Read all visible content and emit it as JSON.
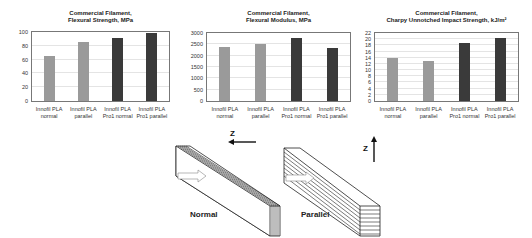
{
  "chart_data": [
    {
      "type": "bar",
      "title": "Commercial Filament, Flexural Strength, MPa",
      "title_lines": [
        "Commercial Filament,",
        "Flexural Strength, MPa"
      ],
      "categories": [
        "Innofil PLA normal",
        "Innofil PLA parallel",
        "Innofil PLA Pro1 normal",
        "Innofil PLA Pro1 parallel"
      ],
      "category_lines": [
        [
          "Innofil PLA",
          "normal"
        ],
        [
          "Innofil PLA",
          "parallel"
        ],
        [
          "Innofil PLA",
          "Pro1 normal"
        ],
        [
          "Innofil PLA",
          "Pro1 parallel"
        ]
      ],
      "values": [
        65,
        85,
        91,
        98
      ],
      "bar_colors": [
        "#9a9a9a",
        "#9a9a9a",
        "#3a3a3a",
        "#3a3a3a"
      ],
      "yticks": [
        0,
        20,
        40,
        60,
        80,
        100
      ],
      "ylim": [
        0,
        100
      ],
      "xlabel": "",
      "ylabel": "",
      "grid": true
    },
    {
      "type": "bar",
      "title": "Commercial Filament, Flexural Modulus, MPa",
      "title_lines": [
        "Commercial Filament,",
        "Flexural Modulus, MPa"
      ],
      "categories": [
        "Innofil PLA normal",
        "Innofil PLA parallel",
        "Innofil PLA Pro1 normal",
        "Innofil PLA Pro1 parallel"
      ],
      "category_lines": [
        [
          "Innofil PLA",
          "normal"
        ],
        [
          "Innofil PLA",
          "parallel"
        ],
        [
          "Innofil PLA",
          "Pro1 normal"
        ],
        [
          "Innofil PLA",
          "Pro1 parallel"
        ]
      ],
      "values": [
        2380,
        2530,
        2800,
        2330
      ],
      "bar_colors": [
        "#9a9a9a",
        "#9a9a9a",
        "#3a3a3a",
        "#3a3a3a"
      ],
      "yticks": [
        0,
        500,
        1000,
        1500,
        2000,
        2500,
        3000
      ],
      "ylim": [
        0,
        3000
      ],
      "xlabel": "",
      "ylabel": "",
      "grid": true
    },
    {
      "type": "bar",
      "title": "Commercial Filament, Charpy Unnotched Impact Strength, kJ/m²",
      "title_lines": [
        "Commercial Filament,",
        "Charpy Unnotched Impact Strength, kJ/m²"
      ],
      "categories": [
        "Innofil PLA normal",
        "Innofil PLA parallel",
        "Innofil PLA Pro1 normal",
        "Innofil PLA Pro1 parallel"
      ],
      "category_lines": [
        [
          "Innofil PLA",
          "normal"
        ],
        [
          "Innofil PLA",
          "parallel"
        ],
        [
          "Innofil PLA",
          "Pro1 normal"
        ],
        [
          "Innofil PLA",
          "Pro1 parallel"
        ]
      ],
      "values": [
        14,
        13,
        18.7,
        20.3
      ],
      "bar_colors": [
        "#9a9a9a",
        "#9a9a9a",
        "#3a3a3a",
        "#3a3a3a"
      ],
      "yticks": [
        0,
        2,
        4,
        6,
        8,
        10,
        12,
        14,
        16,
        18,
        20,
        22
      ],
      "ylim": [
        0,
        22
      ],
      "xlabel": "",
      "ylabel": "",
      "grid": true
    }
  ],
  "diagram": {
    "normal_label": "Normal",
    "parallel_label": "Parallel",
    "z_label_normal": "Z",
    "z_label_parallel": "Z"
  }
}
